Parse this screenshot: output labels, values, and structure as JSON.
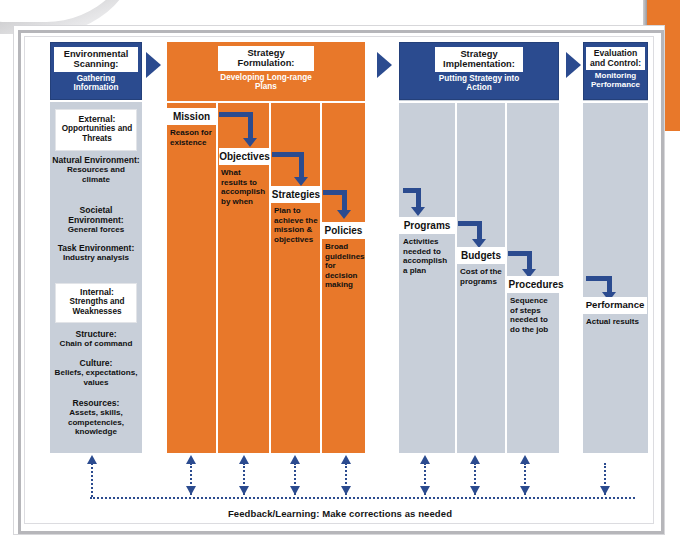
{
  "diagram": {
    "colors": {
      "orange": "#E8782A",
      "blue": "#2B4B8F",
      "gray_panel": "#C8CFD9",
      "white": "#FFFFFF"
    },
    "feedback_caption": "Feedback/Learning: Make corrections as needed",
    "stages": [
      {
        "id": "environmental-scanning",
        "header_title": "Environmental Scanning:",
        "header_subtitle": "Gathering Information",
        "header_style": "blue",
        "groups": [
          {
            "label": "External:",
            "label_sub": "Opportunities and Threats",
            "items": [
              {
                "title": "Natural Environment:",
                "detail": "Resources and climate"
              },
              {
                "title": "Societal Environment:",
                "detail": "General forces"
              },
              {
                "title": "Task Environment:",
                "detail": "Industry analysis"
              }
            ]
          },
          {
            "label": "Internal:",
            "label_sub": "Strengths and Weaknesses",
            "items": [
              {
                "title": "Structure:",
                "detail": "Chain of command"
              },
              {
                "title": "Culture:",
                "detail": "Beliefs, expectations, values"
              },
              {
                "title": "Resources:",
                "detail": "Assets, skills, competencies, knowledge"
              }
            ]
          }
        ]
      },
      {
        "id": "strategy-formulation",
        "header_title": "Strategy Formulation:",
        "header_subtitle": "Developing Long-range Plans",
        "header_style": "orange",
        "steps": [
          {
            "label": "Mission",
            "detail": "Reason for existence"
          },
          {
            "label": "Objectives",
            "detail": "What results to accomplish by when"
          },
          {
            "label": "Strategies",
            "detail": "Plan to achieve the mission & objectives"
          },
          {
            "label": "Policies",
            "detail": "Broad guidelines for decision making"
          }
        ]
      },
      {
        "id": "strategy-implementation",
        "header_title": "Strategy Implementation:",
        "header_subtitle": "Putting Strategy into Action",
        "header_style": "blue",
        "steps": [
          {
            "label": "Programs",
            "detail": "Activities needed to accomplish a plan"
          },
          {
            "label": "Budgets",
            "detail": "Cost of the programs"
          },
          {
            "label": "Procedures",
            "detail": "Sequence of steps needed to do the job"
          }
        ]
      },
      {
        "id": "evaluation-and-control",
        "header_title": "Evaluation and Control:",
        "header_subtitle": "Monitoring Performance",
        "header_style": "blue",
        "steps": [
          {
            "label": "Performance",
            "detail": "Actual results"
          }
        ]
      }
    ]
  }
}
